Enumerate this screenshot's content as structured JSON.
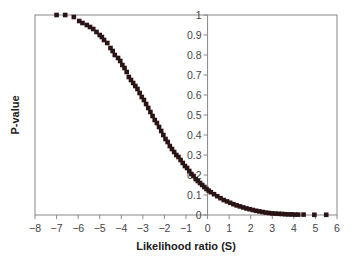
{
  "chart_data": {
    "type": "scatter",
    "title": "",
    "xlabel": "Likelihood ratio (S)",
    "ylabel": "P-value",
    "xlim": [
      -8,
      6
    ],
    "ylim": [
      0,
      1
    ],
    "x_ticks": [
      -8,
      -7,
      -6,
      -5,
      -4,
      -3,
      -2,
      -1,
      0,
      1,
      2,
      3,
      4,
      5,
      6
    ],
    "x_tick_labels": [
      "−8",
      "−7",
      "−6",
      "−5",
      "−4",
      "−3",
      "−2",
      "−1",
      "0",
      "1",
      "2",
      "3",
      "4",
      "5",
      "6"
    ],
    "y_ticks": [
      0,
      0.1,
      0.2,
      0.3,
      0.4,
      0.5,
      0.6,
      0.7,
      0.8,
      0.9,
      1
    ],
    "y_tick_labels": [
      "0",
      "0.1",
      "0.2",
      "0.3",
      "0.4",
      "0.5",
      "0.6",
      "0.7",
      "0.8",
      "0.9",
      "1"
    ],
    "y_axis_position_x": 0,
    "grid": false,
    "legend": null,
    "marker": "square",
    "marker_color": "#2a1416",
    "series": [
      {
        "name": "P-value vs S",
        "points": [
          [
            -7.0,
            1.0
          ],
          [
            -6.6,
            1.0
          ],
          [
            -6.2,
            0.99
          ],
          [
            -5.95,
            0.97
          ],
          [
            -5.8,
            0.96
          ],
          [
            -5.6,
            0.95
          ],
          [
            -5.45,
            0.94
          ],
          [
            -5.3,
            0.93
          ],
          [
            -5.15,
            0.915
          ],
          [
            -5.0,
            0.9
          ],
          [
            -4.9,
            0.89
          ],
          [
            -4.8,
            0.875
          ],
          [
            -4.65,
            0.86
          ],
          [
            -4.5,
            0.835
          ],
          [
            -4.4,
            0.82
          ],
          [
            -4.3,
            0.8
          ],
          [
            -4.15,
            0.785
          ],
          [
            -4.05,
            0.77
          ],
          [
            -3.95,
            0.75
          ],
          [
            -3.85,
            0.735
          ],
          [
            -3.75,
            0.715
          ],
          [
            -3.65,
            0.69
          ],
          [
            -3.55,
            0.675
          ],
          [
            -3.45,
            0.66
          ],
          [
            -3.35,
            0.645
          ],
          [
            -3.25,
            0.63
          ],
          [
            -3.15,
            0.61
          ],
          [
            -3.05,
            0.59
          ],
          [
            -2.95,
            0.575
          ],
          [
            -2.85,
            0.555
          ],
          [
            -2.75,
            0.535
          ],
          [
            -2.65,
            0.515
          ],
          [
            -2.55,
            0.495
          ],
          [
            -2.45,
            0.475
          ],
          [
            -2.35,
            0.46
          ],
          [
            -2.25,
            0.44
          ],
          [
            -2.15,
            0.42
          ],
          [
            -2.05,
            0.4
          ],
          [
            -1.95,
            0.38
          ],
          [
            -1.85,
            0.365
          ],
          [
            -1.75,
            0.345
          ],
          [
            -1.65,
            0.33
          ],
          [
            -1.55,
            0.315
          ],
          [
            -1.45,
            0.3
          ],
          [
            -1.35,
            0.29
          ],
          [
            -1.25,
            0.275
          ],
          [
            -1.15,
            0.26
          ],
          [
            -1.05,
            0.245
          ],
          [
            -0.95,
            0.235
          ],
          [
            -0.85,
            0.22
          ],
          [
            -0.75,
            0.205
          ],
          [
            -0.65,
            0.195
          ],
          [
            -0.55,
            0.18
          ],
          [
            -0.45,
            0.17
          ],
          [
            -0.35,
            0.16
          ],
          [
            -0.25,
            0.15
          ],
          [
            -0.15,
            0.14
          ],
          [
            -0.05,
            0.13
          ],
          [
            0.05,
            0.122
          ],
          [
            0.15,
            0.114
          ],
          [
            0.3,
            0.104
          ],
          [
            0.45,
            0.094
          ],
          [
            0.6,
            0.084
          ],
          [
            0.75,
            0.075
          ],
          [
            0.9,
            0.068
          ],
          [
            1.05,
            0.061
          ],
          [
            1.2,
            0.054
          ],
          [
            1.35,
            0.048
          ],
          [
            1.5,
            0.043
          ],
          [
            1.65,
            0.038
          ],
          [
            1.8,
            0.033
          ],
          [
            1.95,
            0.029
          ],
          [
            2.1,
            0.025
          ],
          [
            2.25,
            0.021
          ],
          [
            2.4,
            0.018
          ],
          [
            2.55,
            0.015
          ],
          [
            2.7,
            0.012
          ],
          [
            2.85,
            0.01
          ],
          [
            3.0,
            0.008
          ],
          [
            3.15,
            0.007
          ],
          [
            3.3,
            0.006
          ],
          [
            3.45,
            0.005
          ],
          [
            3.6,
            0.004
          ],
          [
            3.75,
            0.003
          ],
          [
            3.9,
            0.003
          ],
          [
            4.05,
            0.002
          ],
          [
            4.2,
            0.002
          ],
          [
            4.45,
            0.002
          ],
          [
            4.95,
            0.001
          ],
          [
            5.5,
            0.001
          ]
        ]
      }
    ]
  }
}
